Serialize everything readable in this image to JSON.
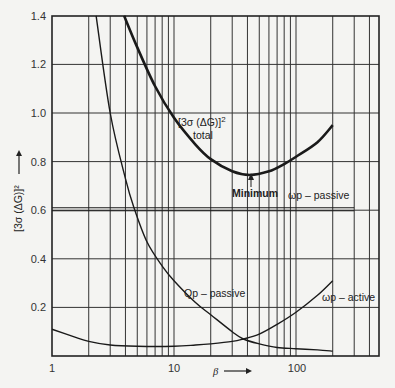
{
  "chart_data": {
    "type": "line",
    "title": "",
    "xlabel": "β →",
    "ylabel": "[3σ (ΔG)]² →",
    "xscale": "log",
    "xlim": [
      1,
      400
    ],
    "ylim": [
      0,
      1.4
    ],
    "grid": true,
    "x_tick_labels": [
      "1",
      "10",
      "100"
    ],
    "y_tick_labels": [
      "0.2",
      "0.4",
      "0.6",
      "0.8",
      "1.0",
      "1.2",
      "1.4"
    ],
    "series": [
      {
        "name": "[3σ (ΔG)]² total",
        "x": [
          3.9,
          5,
          7,
          10,
          15,
          20,
          30,
          42,
          60,
          80,
          100,
          150,
          200
        ],
        "y": [
          1.4,
          1.27,
          1.11,
          0.98,
          0.87,
          0.81,
          0.76,
          0.745,
          0.76,
          0.79,
          0.82,
          0.88,
          0.95
        ]
      },
      {
        "name": "Qp – passive",
        "x": [
          2.3,
          3,
          4,
          4.7,
          6,
          8,
          10,
          15,
          20,
          30,
          37,
          50,
          70,
          100,
          150,
          200
        ],
        "y": [
          1.4,
          1.0,
          0.73,
          0.61,
          0.47,
          0.37,
          0.31,
          0.22,
          0.17,
          0.1,
          0.07,
          0.05,
          0.035,
          0.03,
          0.025,
          0.02
        ]
      },
      {
        "name": "ωp – active",
        "x": [
          1,
          1.5,
          2,
          3,
          5,
          10,
          15,
          20,
          30,
          37,
          50,
          70,
          100,
          150,
          200
        ],
        "y": [
          0.11,
          0.08,
          0.06,
          0.045,
          0.04,
          0.04,
          0.045,
          0.05,
          0.06,
          0.07,
          0.09,
          0.13,
          0.18,
          0.25,
          0.31
        ]
      },
      {
        "name": "ωp – passive",
        "x": [
          1,
          300
        ],
        "y": [
          0.61,
          0.61
        ]
      }
    ],
    "annotations": [
      {
        "text": "Minimum",
        "x": 42,
        "y": 0.745,
        "arrow": true
      },
      {
        "text": "[3σ (ΔG)]²",
        "sub": "total"
      },
      {
        "text": "ωp – passive"
      },
      {
        "text": "Qp – passive"
      },
      {
        "text": "ωp – active"
      }
    ]
  },
  "labels": {
    "y_axis": "[3σ (ΔG)]²",
    "x_axis": "β",
    "total_line1": "[3σ (ΔG)]",
    "total_sup": "2",
    "total_line2": "total",
    "minimum": "Minimum",
    "wp_passive": "ωp – passive",
    "qp_passive": "Qp – passive",
    "wp_active": "ωp – active"
  },
  "ticks": {
    "y": [
      "1.4",
      "1.2",
      "1.0",
      "0.8",
      "0.6",
      "0.4",
      "0.2"
    ],
    "x": [
      "1",
      "10",
      "100"
    ]
  }
}
